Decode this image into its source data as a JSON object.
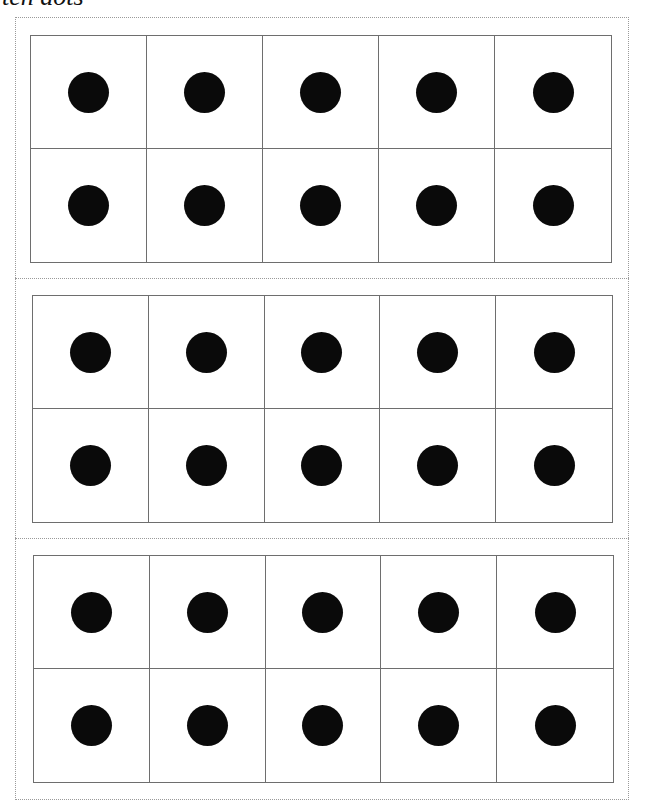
{
  "caption": "ten dots",
  "colors": {
    "dot": "#0a0a0a",
    "grid_line": "#6e6e6e",
    "dotted_border": "#9a9a9a",
    "background": "#ffffff"
  },
  "ten_frames": [
    {
      "rows": 2,
      "cols": 5,
      "filled": [
        1,
        1,
        1,
        1,
        1,
        1,
        1,
        1,
        1,
        1
      ],
      "box": {
        "left": 30,
        "top": 35,
        "width": 582,
        "height": 228
      }
    },
    {
      "rows": 2,
      "cols": 5,
      "filled": [
        1,
        1,
        1,
        1,
        1,
        1,
        1,
        1,
        1,
        1
      ],
      "box": {
        "left": 32,
        "top": 295,
        "width": 581,
        "height": 228
      }
    },
    {
      "rows": 2,
      "cols": 5,
      "filled": [
        1,
        1,
        1,
        1,
        1,
        1,
        1,
        1,
        1,
        1
      ],
      "box": {
        "left": 33,
        "top": 555,
        "width": 581,
        "height": 228
      }
    }
  ],
  "separators_y": [
    278,
    538
  ]
}
